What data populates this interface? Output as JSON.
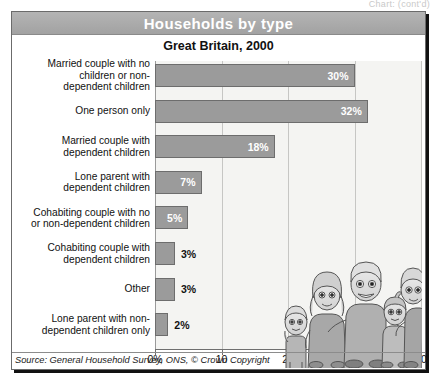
{
  "top_fragment": "Chart: (cont'd)",
  "card": {
    "title": "Households by type",
    "subtitle": "Great Britain, 2000",
    "source": "Source: General Household Survey, ONS, © Crown Copyright"
  },
  "colors": {
    "header_bg": "#ababab",
    "header_text": "#ffffff",
    "bar_fill": "#9b9b9b",
    "bar_stroke": "#6d6d6d",
    "plot_bg": "#f4f4f2",
    "gridline": "#c6c6c4",
    "axis": "#6f6f6f",
    "frame": "#6b6b6b",
    "label_text": "#111111"
  },
  "illustration": {
    "name": "cartoon-family-illustration",
    "description": "Grayscale cartoon family of five standing together"
  },
  "chart_data": {
    "type": "bar",
    "orientation": "horizontal",
    "title": "Households by type",
    "subtitle": "Great Britain, 2000",
    "xlabel": "",
    "ylabel": "",
    "xlim": [
      0,
      40
    ],
    "xticks": [
      0,
      10,
      20,
      30,
      40
    ],
    "xticklabels": [
      "0%",
      "10",
      "20",
      "30",
      "40"
    ],
    "grid": true,
    "grid_axis": "x",
    "legend": "none",
    "source": "Source: General Household Survey, ONS, © Crown Copyright",
    "categories": [
      "Married couple with no children or non-dependent children",
      "One person only",
      "Married couple with dependent children",
      "Lone parent with dependent children",
      "Cohabiting couple with no or non-dependent children",
      "Cohabiting couple with dependent children",
      "Other",
      "Lone parent with non-dependent children only"
    ],
    "values": [
      30,
      32,
      18,
      7,
      5,
      3,
      3,
      2
    ],
    "data_labels": [
      "30%",
      "32%",
      "18%",
      "7%",
      "5%",
      "3%",
      "3%",
      "2%"
    ],
    "label_lines": [
      [
        "Married couple with no",
        "children or non-",
        "dependent children"
      ],
      [
        "One person only"
      ],
      [
        "Married couple with",
        "dependent children"
      ],
      [
        "Lone parent with",
        "dependent children"
      ],
      [
        "Cohabiting couple with no",
        "or non-dependent children"
      ],
      [
        "Cohabiting couple with",
        "dependent children"
      ],
      [
        "Other"
      ],
      [
        "Lone parent with non-",
        "dependent children only"
      ]
    ],
    "label_placement": [
      "inside",
      "inside",
      "inside",
      "inside",
      "inside",
      "outside",
      "outside",
      "outside"
    ]
  }
}
